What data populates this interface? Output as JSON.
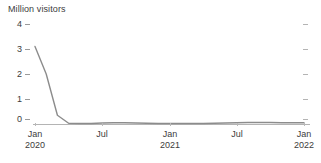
{
  "chart_data": {
    "type": "line",
    "title": "Million visitors",
    "xlabel": "",
    "ylabel": "Million visitors",
    "ylim": [
      0,
      4
    ],
    "yticks": [
      0,
      1,
      2,
      3,
      4
    ],
    "ytick_labels": [
      "0",
      "1",
      "2",
      "3",
      "4"
    ],
    "grid": false,
    "legend": "none",
    "line_color": "#8c8c8c",
    "axis_color": "#9a9a9a",
    "text_color": "#3c3c3c",
    "xtick_labels": [
      {
        "month": "Jan",
        "year": "2020"
      },
      {
        "month": "Jul",
        "year": ""
      },
      {
        "month": "Jan",
        "year": "2021"
      },
      {
        "month": "Jul",
        "year": ""
      },
      {
        "month": "Jan",
        "year": "2022"
      }
    ],
    "x": [
      "2020-01",
      "2020-02",
      "2020-03",
      "2020-04",
      "2020-05",
      "2020-06",
      "2020-07",
      "2020-08",
      "2020-09",
      "2020-10",
      "2020-11",
      "2020-12",
      "2021-01",
      "2021-02",
      "2021-03",
      "2021-04",
      "2021-05",
      "2021-06",
      "2021-07",
      "2021-08",
      "2021-09",
      "2021-10",
      "2021-11",
      "2021-12",
      "2022-01"
    ],
    "series": [
      {
        "name": "Million visitors",
        "values": [
          3.1,
          2.0,
          0.35,
          0.03,
          0.02,
          0.02,
          0.04,
          0.05,
          0.05,
          0.04,
          0.03,
          0.02,
          0.02,
          0.02,
          0.02,
          0.02,
          0.03,
          0.04,
          0.05,
          0.06,
          0.06,
          0.06,
          0.05,
          0.05,
          0.05
        ]
      }
    ]
  }
}
